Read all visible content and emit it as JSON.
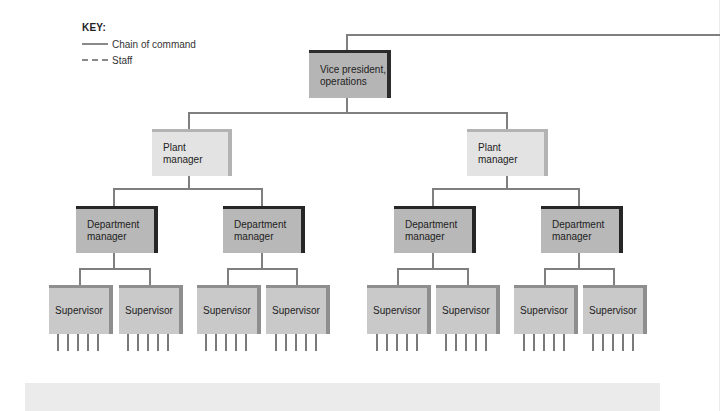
{
  "key": {
    "title": "KEY:",
    "items": [
      {
        "style": "solid",
        "label": "Chain of command"
      },
      {
        "style": "dashed",
        "label": "Staff"
      }
    ]
  },
  "chart": {
    "vp": {
      "label": "Vice president,\noperations"
    },
    "plants": [
      {
        "label": "Plant\nmanager",
        "departments": [
          {
            "label": "Department\nmanager",
            "supervisors": [
              {
                "label": "Supervisor",
                "reports": 5
              },
              {
                "label": "Supervisor",
                "reports": 5
              }
            ]
          },
          {
            "label": "Department\nmanager",
            "supervisors": [
              {
                "label": "Supervisor",
                "reports": 5
              },
              {
                "label": "Supervisor",
                "reports": 5
              }
            ]
          }
        ]
      },
      {
        "label": "Plant\nmanager",
        "departments": [
          {
            "label": "Department\nmanager",
            "supervisors": [
              {
                "label": "Supervisor",
                "reports": 5
              },
              {
                "label": "Supervisor",
                "reports": 5
              }
            ]
          },
          {
            "label": "Department\nmanager",
            "supervisors": [
              {
                "label": "Supervisor",
                "reports": 5
              },
              {
                "label": "Supervisor",
                "reports": 5
              }
            ]
          }
        ]
      }
    ]
  },
  "colors": {
    "line": "#7f7f7f",
    "vp_fill": "#b5b5b5",
    "plant_fill": "#e3e3e3",
    "dept_fill": "#b8b8b8",
    "supervisor_fill": "#c9c9c9"
  }
}
